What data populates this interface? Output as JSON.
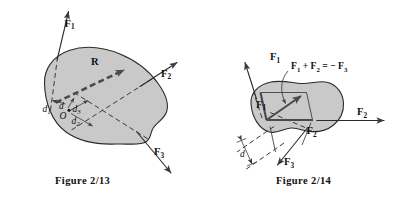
{
  "figures": [
    {
      "id": "figure-2-13",
      "caption": "Figure  2/13",
      "description": "Rigid body with three forces and their resultant R, showing moment arms about point O",
      "body_fill": "#c9c9c9",
      "body_stroke": "#2b2b2b",
      "labels": {
        "force_1": "F",
        "force_1_sub": "1",
        "force_2": "F",
        "force_2_sub": "2",
        "force_3": "F",
        "force_3_sub": "3",
        "resultant": "R",
        "origin": "O",
        "arm": "d",
        "arm_1": "d",
        "arm_1_sub": "1",
        "arm_2": "d",
        "arm_2_sub": "2",
        "arm_3": "d",
        "arm_3_sub": "3"
      }
    },
    {
      "id": "figure-2-14",
      "caption": "Figure  2/14",
      "description": "Rigid body with parallelogram addition of F1 and F2 equal to minus F3, with offset distance d",
      "body_fill": "#c9c9c9",
      "body_stroke": "#2b2b2b",
      "labels": {
        "force_1": "F",
        "force_1_sub": "1",
        "force_2_inner": "F",
        "force_2_inner_sub": "2",
        "force_2_outer": "F",
        "force_2_outer_sub": "2",
        "force_3": "F",
        "force_3_sub": "3",
        "force_1_outer": "F",
        "force_1_outer_sub": "1",
        "arm": "d"
      },
      "equation": {
        "term_1": "F",
        "term_1_sub": "1",
        "plus": "+",
        "term_2": "F",
        "term_2_sub": "2",
        "equals": "=",
        "minus": "−",
        "term_3": "F",
        "term_3_sub": "3",
        "full_text": "F1 + F2 = - F3"
      }
    }
  ]
}
